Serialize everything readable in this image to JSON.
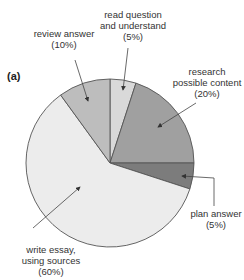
{
  "chart_data": {
    "type": "pie",
    "title": "",
    "panel_label": "(a)",
    "start_angle_deg": 0,
    "direction": "clockwise",
    "slices": [
      {
        "label": "read question and understand",
        "value": 5,
        "value_label": "(5%)",
        "color": "#d9d9d9"
      },
      {
        "label": "research possible content",
        "value": 20,
        "value_label": "(20%)",
        "color": "#a0a0a0"
      },
      {
        "label": "plan answer",
        "value": 5,
        "value_label": "(5%)",
        "color": "#7c7c7c"
      },
      {
        "label": "write essay, using sources",
        "value": 60,
        "value_label": "(60%)",
        "color": "#ececec"
      },
      {
        "label": "review answer",
        "value": 10,
        "value_label": "(10%)",
        "color": "#bdbdbd"
      }
    ],
    "legend": "none (callout labels with arrows)"
  },
  "labels": {
    "panel": "(a)",
    "read": [
      "read question",
      "and understand",
      "(5%)"
    ],
    "research": [
      "research",
      "possible content",
      "(20%)"
    ],
    "plan": [
      "plan answer",
      "(5%)"
    ],
    "write": [
      "write essay,",
      "using sources",
      "(60%)"
    ],
    "review": [
      "review answer",
      "(10%)"
    ]
  }
}
